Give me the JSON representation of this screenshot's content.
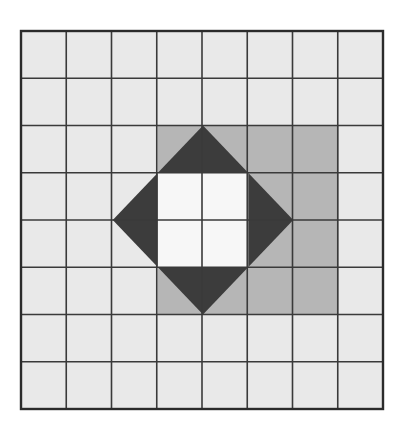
{
  "figure": {
    "type": "geometry-diagram",
    "alt_text": "An 8 by 8 square grid. A medium gray square region four cells wide is centered in the grid. Inside it a dark gray square rotated 45 degrees is inscribed, and inside that rotated square a white square two cells wide sits at the center.",
    "grid": {
      "columns": 8,
      "rows": 8,
      "origin_x": 21,
      "origin_y": 31,
      "cell_width": 45.25,
      "cell_height": 47.25,
      "line_color": "#3a3a3a",
      "line_width": 1.6,
      "outer_border_color": "#2b2b2b",
      "outer_border_width": 2.4,
      "cell_fill": "#e9e9e9"
    },
    "shapes": [
      {
        "name": "medium-gray-square",
        "fill": "#b6b6b6",
        "col_start": 3,
        "col_end": 7,
        "row_start": 2,
        "row_end": 6,
        "points_px": [
          [
            157.75,
            125.5
          ],
          [
            338.75,
            125.5
          ],
          [
            338.75,
            314.5
          ],
          [
            157.75,
            314.5
          ]
        ]
      },
      {
        "name": "dark-rotated-square",
        "fill": "#3c3c3c",
        "rotation_deg": 45,
        "points_px": [
          [
            203.0,
            125.5
          ],
          [
            293.25,
            220.0
          ],
          [
            203.0,
            314.5
          ],
          [
            112.75,
            220.0
          ]
        ]
      },
      {
        "name": "white-center-square",
        "fill": "#f7f7f7",
        "col_start": 4,
        "col_end": 6,
        "row_start": 3,
        "row_end": 5,
        "points_px": [
          [
            157.75,
            172.75
          ],
          [
            248.25,
            172.75
          ],
          [
            248.25,
            267.25
          ],
          [
            157.75,
            267.25
          ]
        ]
      }
    ],
    "colors": {
      "background": "#ffffff",
      "cell_light": "#e9e9e9",
      "gray_medium": "#b6b6b6",
      "gray_dark": "#3c3c3c",
      "center_white": "#f7f7f7",
      "gridline": "#3a3a3a"
    }
  },
  "chart_data": {
    "type": "heatmap",
    "xlabel": "",
    "ylabel": "",
    "categories": [
      "1",
      "2",
      "3",
      "4",
      "5",
      "6",
      "7",
      "8"
    ],
    "row_labels": [
      "1",
      "2",
      "3",
      "4",
      "5",
      "6",
      "7",
      "8"
    ],
    "legend": [
      {
        "label": "unshaded cell",
        "color": "#e9e9e9"
      },
      {
        "label": "medium gray region",
        "color": "#b6b6b6"
      },
      {
        "label": "dark rotated square",
        "color": "#3c3c3c"
      },
      {
        "label": "white center square",
        "color": "#f7f7f7"
      }
    ],
    "values": [
      [
        "light",
        "light",
        "light",
        "light",
        "light",
        "light",
        "light",
        "light"
      ],
      [
        "light",
        "light",
        "light",
        "light",
        "light",
        "light",
        "light",
        "light"
      ],
      [
        "light",
        "light",
        "light",
        "gray/dark",
        "dark/gray",
        "gray/dark",
        "light",
        "light"
      ],
      [
        "light",
        "light",
        "gray/dark",
        "white",
        "white",
        "dark/gray",
        "light",
        "light"
      ],
      [
        "light",
        "light",
        "gray/dark",
        "white",
        "white",
        "dark/gray",
        "light",
        "light"
      ],
      [
        "light",
        "light",
        "light",
        "gray/dark",
        "dark/gray",
        "gray/dark",
        "light",
        "light"
      ],
      [
        "light",
        "light",
        "light",
        "light",
        "light",
        "light",
        "light",
        "light"
      ],
      [
        "light",
        "light",
        "light",
        "light",
        "light",
        "light",
        "light",
        "light"
      ]
    ]
  }
}
